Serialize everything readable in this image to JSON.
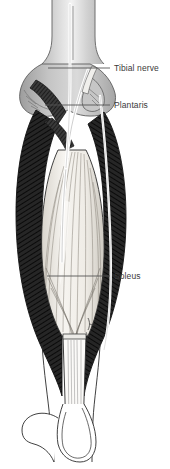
{
  "figure": {
    "name": "posterior-lower-leg-anatomy",
    "view": "posterior",
    "background_color": "#ffffff"
  },
  "labels": [
    {
      "id": "tibial-nerve",
      "text": "Tibial nerve",
      "text_x": 114,
      "text_y": 63,
      "leader": {
        "x1": 48,
        "y1": 68,
        "x2": 110,
        "y2": 68
      }
    },
    {
      "id": "plantaris",
      "text": "Plantaris",
      "text_x": 114,
      "text_y": 100,
      "leader": {
        "x1": 45,
        "y1": 105,
        "x2": 110,
        "y2": 105
      }
    },
    {
      "id": "soleus",
      "text": "Soleus",
      "text_x": 114,
      "text_y": 271,
      "leader": {
        "x1": 47,
        "y1": 276,
        "x2": 110,
        "y2": 276
      }
    }
  ],
  "structures": [
    {
      "id": "femur-shaft",
      "name": "Femur shaft",
      "fill": "#c9c9c9"
    },
    {
      "id": "femoral-condyles",
      "name": "Femoral condyles",
      "fill": "#b0b0b0"
    },
    {
      "id": "gastrocnemius-medial",
      "name": "Medial head of gastrocnemius",
      "fill": "#2a2a2a"
    },
    {
      "id": "gastrocnemius-lateral",
      "name": "Lateral head of gastrocnemius",
      "fill": "#2a2a2a"
    },
    {
      "id": "soleus-muscle",
      "name": "Soleus",
      "fill": "#f2f0ec"
    },
    {
      "id": "plantaris-tendon",
      "name": "Plantaris tendon",
      "fill": "#ffffff"
    },
    {
      "id": "tibial-nerve-strand",
      "name": "Tibial nerve",
      "fill": "#ffffff"
    },
    {
      "id": "achilles-tendon",
      "name": "Calcaneal (Achilles) tendon",
      "fill": "#fbfaf8"
    },
    {
      "id": "calcaneus",
      "name": "Calcaneus",
      "fill": "#ffffff"
    }
  ],
  "palette": {
    "outline": "#1e1e1e",
    "muscle_dark": "#2a2a2a",
    "muscle_hatch": "#0f0f0f",
    "bone_light": "#dcdcdc",
    "bone_mid": "#b0b0b0",
    "tendon_pale": "#f4f2ee",
    "label_text": "#3a3a3a",
    "leader_line": "#555555"
  }
}
